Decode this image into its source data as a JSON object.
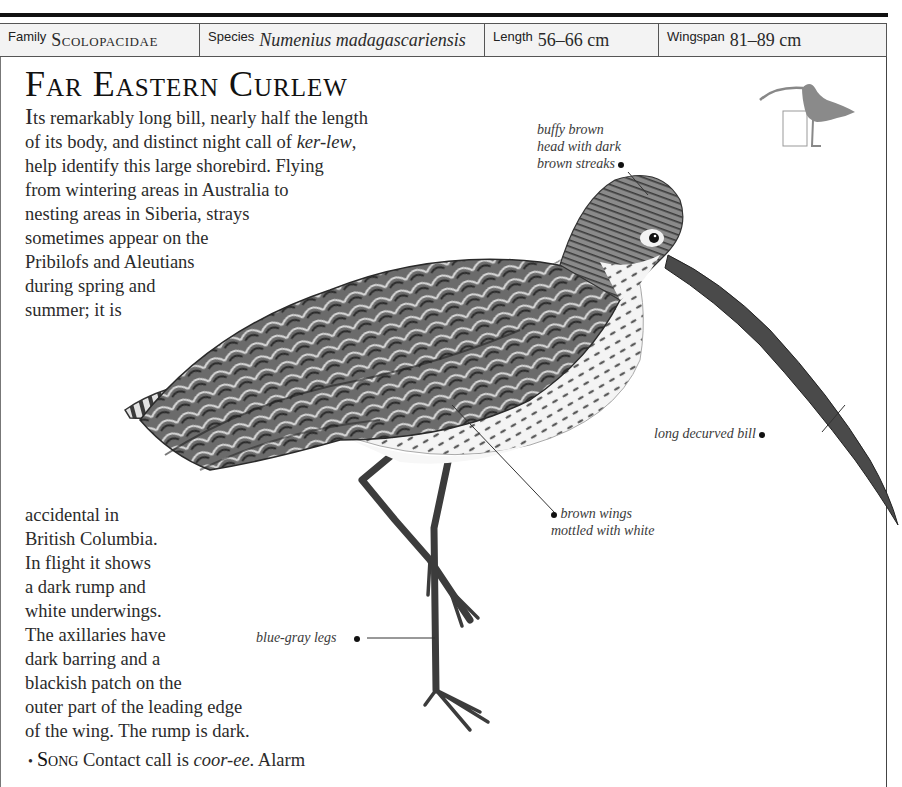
{
  "spec_bar": {
    "family": {
      "label": "Family",
      "value": "Scolopacidae"
    },
    "species": {
      "label": "Species",
      "value": "Numenius madagascariensis"
    },
    "length": {
      "label": "Length",
      "value": "56–66 cm"
    },
    "wingspan": {
      "label": "Wingspan",
      "value": "81–89 cm"
    }
  },
  "title": "Far Eastern Curlew",
  "description": {
    "top_lines": [
      {
        "drop": "I",
        "text": "ts remarkably long bill, nearly half the length"
      },
      {
        "pre": "of its body, and distinct night call of ",
        "italic": "ker-lew",
        "post": ","
      },
      {
        "text": "help identify this large shorebird. Flying"
      },
      {
        "text": "from wintering areas in Australia to"
      },
      {
        "text": "nesting areas in Siberia, strays"
      },
      {
        "text": "sometimes appear on the"
      },
      {
        "text": "Pribilofs and Aleutians"
      },
      {
        "text": "during spring and"
      },
      {
        "text": "summer; it is"
      }
    ],
    "bottom_lines": [
      "accidental in",
      "British Columbia.",
      "In flight it shows",
      "a dark rump and",
      "white underwings.",
      "The axillaries have",
      "dark barring and a",
      "blackish patch on the",
      "outer part of the leading edge",
      "of the wing. The rump is dark."
    ]
  },
  "song": {
    "bullet": "•",
    "heading": "Song",
    "pre": " Contact call is ",
    "italic": "coor-ee",
    "post": ". Alarm",
    "cutoff_line": "call is a harsh, rapid, lilting ..."
  },
  "callouts": {
    "head": [
      "buffy brown",
      "head with dark",
      "brown streaks"
    ],
    "bill": "long decurved bill",
    "wings": [
      "brown wings",
      "mottled with white"
    ],
    "legs": "blue-gray legs"
  },
  "illustration": {
    "main": "curlew-illustration",
    "thumbnail": "perching-bird-silhouette"
  },
  "colors": {
    "rule": "#111111",
    "spec_bg": "#f3f3f3",
    "text": "#2b2b2b",
    "silhouette": "#8a8a8a"
  }
}
